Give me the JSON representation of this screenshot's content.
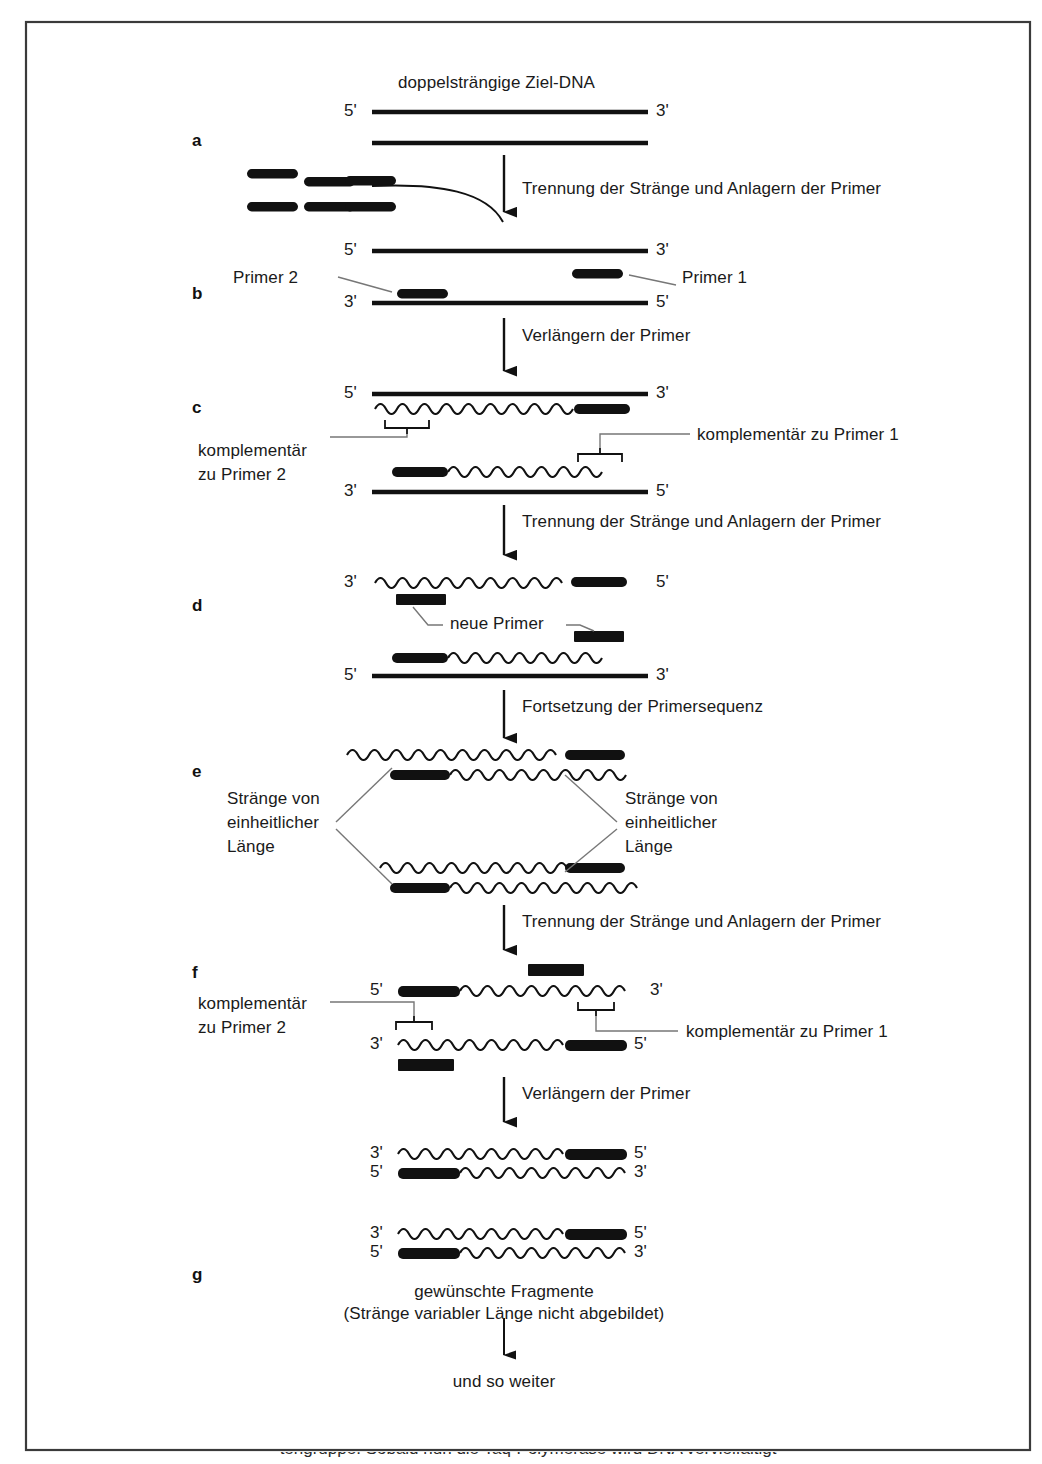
{
  "figure": {
    "title": "doppelsträngige Ziel-DNA",
    "language": "de",
    "frame": {
      "border_color": "#333333"
    },
    "panel_letters": [
      "a",
      "b",
      "c",
      "d",
      "e",
      "f",
      "g"
    ],
    "prime_labels": {
      "five": "5'",
      "three": "3'"
    },
    "ink_color": "#111111",
    "leader_color": "#777777"
  },
  "steps": {
    "a_to_b": "Trennung der Stränge und Anlagern der Primer",
    "b_to_c": "Verlängern der Primer",
    "c_to_d": "Trennung der Stränge und Anlagern der Primer",
    "d_to_e": "Fortsetzung der Primersequenz",
    "e_to_f": "Trennung der Stränge und Anlagern der Primer",
    "f_to_g": "Verlängern der Primer",
    "g_out": "und so weiter"
  },
  "annotations": {
    "primer_1": "Primer 1",
    "primer_2": "Primer 2",
    "compl_primer_1": "komplementär zu Primer 1",
    "compl_primer_2_line1": "komplementär",
    "compl_primer_2_line2": "zu Primer 2",
    "new_primers": "neue Primer",
    "uniform_left_line1": "Stränge von",
    "uniform_left_line2": "einheitlicher",
    "uniform_left_line3": "Länge",
    "uniform_right_line1": "Stränge von",
    "uniform_right_line2": "einheitlicher",
    "uniform_right_line3": "Länge",
    "desired_line1": "gewünschte Fragmente",
    "desired_line2": "(Stränge variabler Länge nicht abgebildet)"
  },
  "cut_caption": "tengruppe. Sobald nun die Taq-Polymerase wird DNA vervielfältigt"
}
